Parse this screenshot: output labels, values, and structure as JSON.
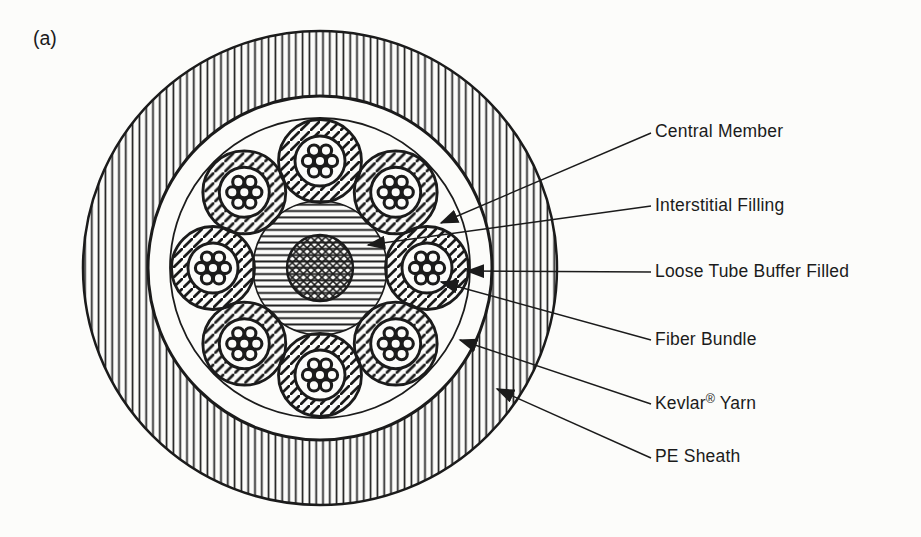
{
  "figure": {
    "panel_label": "(a)",
    "type": "fiber-optic-cable-cross-section",
    "colors": {
      "ink": "#1b1b1b",
      "paper": "#fcfcfa"
    }
  },
  "labels": [
    {
      "id": "central-member",
      "text": "Central Member"
    },
    {
      "id": "interstitial-filling",
      "text": "Interstitial Filling"
    },
    {
      "id": "loose-tube",
      "text": "Loose Tube Buffer Filled"
    },
    {
      "id": "fiber-bundle",
      "text": "Fiber Bundle"
    },
    {
      "id": "kevlar-yarn",
      "text_pre": "Kevlar",
      "text_sup": "®",
      "text_post": "Yarn"
    },
    {
      "id": "pe-sheath",
      "text": "PE Sheath"
    }
  ],
  "diagram": {
    "tube_count": 8,
    "fibers_per_tube": 7,
    "parts": [
      {
        "name": "Central Member",
        "pattern": "crosshatch"
      },
      {
        "name": "Interstitial Filling",
        "pattern": "horizontal-hatch"
      },
      {
        "name": "Loose Tube Buffer Filled",
        "pattern": "diagonal-hatch"
      },
      {
        "name": "Fiber Bundle",
        "pattern": "fiber-dot-cluster"
      },
      {
        "name": "Kevlar® Yarn",
        "pattern": "plain-ring"
      },
      {
        "name": "PE Sheath",
        "pattern": "vertical-hatch"
      }
    ]
  }
}
